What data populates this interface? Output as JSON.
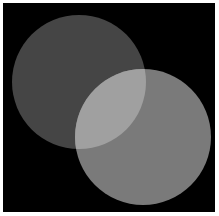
{
  "scene": {
    "description": "Two overlapping translucent gray circles on a black background",
    "background_color": "#000000",
    "frame_color": "#ffffff",
    "circles": [
      {
        "name": "upper-left-circle",
        "cx": 76,
        "cy": 79,
        "r": 67,
        "color": "#454545"
      },
      {
        "name": "lower-right-circle",
        "cx": 140,
        "cy": 134,
        "r": 68,
        "color": "#7a7a7a"
      }
    ],
    "overlap_color": "#a0a0a0"
  }
}
